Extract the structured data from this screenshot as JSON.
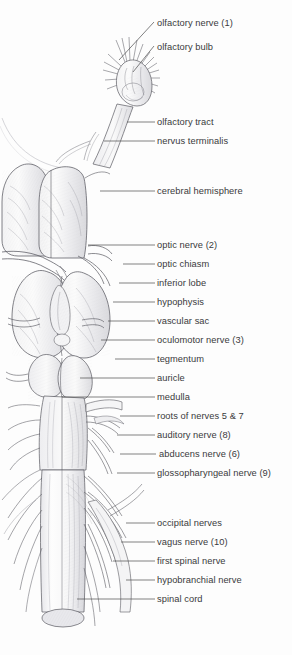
{
  "figure": {
    "background_color": "#fdfdfd",
    "label_color": "#3a3a3c",
    "line_color": "#4a4a4c",
    "drawing_name": "fish-brain-dorsal-anatomical-drawing"
  },
  "labels": [
    {
      "id": "olfactory-nerve",
      "text": "olfactory nerve (1)",
      "x": 157,
      "y": 18,
      "leader": {
        "type": "diagonal",
        "x1": 154,
        "y1": 22,
        "x2": 119,
        "y2": 60
      }
    },
    {
      "id": "olfactory-bulb",
      "text": "olfactory bulb",
      "x": 157,
      "y": 42,
      "leader": {
        "type": "diagonal",
        "x1": 154,
        "y1": 46,
        "x2": 133,
        "y2": 72
      }
    },
    {
      "id": "olfactory-tract",
      "text": "olfactory tract",
      "x": 157,
      "y": 117,
      "leader": {
        "type": "straight",
        "x1": 127,
        "y1": 122,
        "x2": 155,
        "y2": 122
      }
    },
    {
      "id": "nervus-terminalis",
      "text": "nervus terminalis",
      "x": 157,
      "y": 136,
      "leader": {
        "type": "straight",
        "x1": 104,
        "y1": 141,
        "x2": 155,
        "y2": 141
      }
    },
    {
      "id": "cerebral-hemisphere",
      "text": "cerebral hemisphere",
      "x": 157,
      "y": 186,
      "leader": {
        "type": "straight",
        "x1": 100,
        "y1": 191,
        "x2": 155,
        "y2": 191
      }
    },
    {
      "id": "optic-nerve",
      "text": "optic nerve (2)",
      "x": 157,
      "y": 240,
      "leader": {
        "type": "straight",
        "x1": 88,
        "y1": 245,
        "x2": 155,
        "y2": 245
      }
    },
    {
      "id": "optic-chiasm",
      "text": "optic chiasm",
      "x": 157,
      "y": 259,
      "leader": {
        "type": "straight",
        "x1": 123,
        "y1": 264,
        "x2": 155,
        "y2": 264
      }
    },
    {
      "id": "inferior-lobe",
      "text": "inferior lobe",
      "x": 157,
      "y": 278,
      "leader": {
        "type": "straight",
        "x1": 119,
        "y1": 283,
        "x2": 155,
        "y2": 283
      }
    },
    {
      "id": "hypophysis",
      "text": "hypophysis",
      "x": 157,
      "y": 297,
      "leader": {
        "type": "straight",
        "x1": 113,
        "y1": 302,
        "x2": 155,
        "y2": 302
      }
    },
    {
      "id": "vascular-sac",
      "text": "vascular sac",
      "x": 157,
      "y": 316,
      "leader": {
        "type": "straight",
        "x1": 108,
        "y1": 321,
        "x2": 155,
        "y2": 321
      }
    },
    {
      "id": "oculomotor-nerve",
      "text": "oculomotor nerve (3)",
      "x": 157,
      "y": 335,
      "leader": {
        "type": "straight",
        "x1": 101,
        "y1": 340,
        "x2": 155,
        "y2": 340
      }
    },
    {
      "id": "tegmentum",
      "text": "tegmentum",
      "x": 157,
      "y": 354,
      "leader": {
        "type": "straight",
        "x1": 115,
        "y1": 359,
        "x2": 155,
        "y2": 359
      }
    },
    {
      "id": "auricle",
      "text": "auricle",
      "x": 157,
      "y": 373,
      "leader": {
        "type": "straight",
        "x1": 80,
        "y1": 378,
        "x2": 155,
        "y2": 378
      }
    },
    {
      "id": "medulla",
      "text": "medulla",
      "x": 157,
      "y": 392,
      "leader": {
        "type": "straight",
        "x1": 62,
        "y1": 397,
        "x2": 155,
        "y2": 397
      }
    },
    {
      "id": "roots-of-nerves-5-and-7",
      "text": "roots of nerves 5 & 7",
      "x": 157,
      "y": 411,
      "leader": {
        "type": "straight",
        "x1": 120,
        "y1": 416,
        "x2": 155,
        "y2": 416
      }
    },
    {
      "id": "auditory-nerve",
      "text": "auditory nerve (8)",
      "x": 157,
      "y": 430,
      "leader": {
        "type": "straight",
        "x1": 117,
        "y1": 435,
        "x2": 155,
        "y2": 435
      }
    },
    {
      "id": "abducens-nerve",
      "text": "abducens nerve (6)",
      "x": 159,
      "y": 449,
      "leader": {
        "type": "straight",
        "x1": 120,
        "y1": 454,
        "x2": 156,
        "y2": 454
      }
    },
    {
      "id": "glossopharyngeal-nerve",
      "text": "glossopharyngeal nerve (9)",
      "x": 157,
      "y": 468,
      "leader": {
        "type": "straight",
        "x1": 117,
        "y1": 473,
        "x2": 155,
        "y2": 473
      }
    },
    {
      "id": "occipital-nerves",
      "text": "occipital nerves",
      "x": 157,
      "y": 518,
      "leader": {
        "type": "straight",
        "x1": 126,
        "y1": 523,
        "x2": 155,
        "y2": 523
      }
    },
    {
      "id": "vagus-nerve",
      "text": "vagus nerve (10)",
      "x": 157,
      "y": 537,
      "leader": {
        "type": "straight",
        "x1": 121,
        "y1": 542,
        "x2": 155,
        "y2": 542
      }
    },
    {
      "id": "first-spinal-nerve",
      "text": "first spinal nerve",
      "x": 157,
      "y": 556,
      "leader": {
        "type": "straight",
        "x1": 113,
        "y1": 561,
        "x2": 155,
        "y2": 561
      }
    },
    {
      "id": "hypobranchial-nerve",
      "text": "hypobranchial nerve",
      "x": 157,
      "y": 575,
      "leader": {
        "type": "straight",
        "x1": 126,
        "y1": 580,
        "x2": 155,
        "y2": 580
      }
    },
    {
      "id": "spinal-cord",
      "text": "spinal cord",
      "x": 157,
      "y": 594,
      "leader": {
        "type": "straight",
        "x1": 77,
        "y1": 599,
        "x2": 155,
        "y2": 599
      }
    }
  ]
}
